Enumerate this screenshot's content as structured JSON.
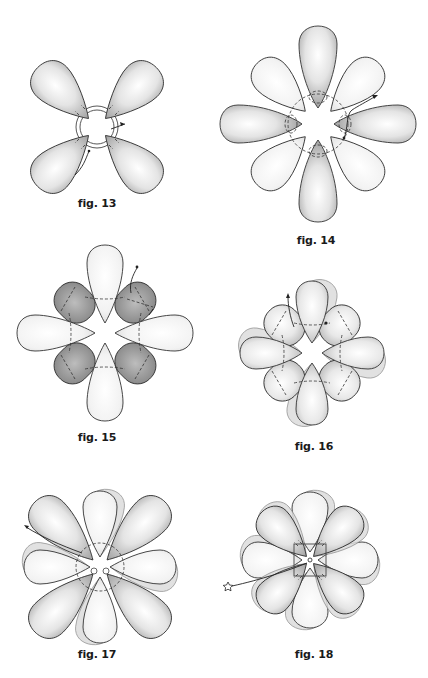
{
  "page": {
    "figures": [
      {
        "id": "fig13",
        "label": "fig. 13",
        "petals": 4,
        "arrangement": "X (diagonal)",
        "shade": "dark"
      },
      {
        "id": "fig14",
        "label": "fig. 14",
        "petals": 8,
        "arrangement": "star, cardinal petals dark",
        "shade": "mixed"
      },
      {
        "id": "fig15",
        "label": "fig. 15",
        "petals": 8,
        "arrangement": "4 long light cardinal + 4 short dark diagonal",
        "shade": "mixed"
      },
      {
        "id": "fig16",
        "label": "fig. 16",
        "petals": 8,
        "arrangement": "layered, 4 cardinal + 4 diagonal",
        "shade": "medium"
      },
      {
        "id": "fig17",
        "label": "fig. 17",
        "petals": 8,
        "arrangement": "dark diagonal over light cardinal layer",
        "shade": "mixed"
      },
      {
        "id": "fig18",
        "label": "fig. 18",
        "petals": 8,
        "arrangement": "dark diagonal over light cardinal, star-bead thread start",
        "shade": "mixed"
      }
    ]
  },
  "colors": {
    "dark_petal_edge": "#8a8a8a",
    "light_petal_edge": "#cfcfcf",
    "petal_center": "#ffffff",
    "outline": "#333333",
    "caption": "#1a1a1a"
  }
}
